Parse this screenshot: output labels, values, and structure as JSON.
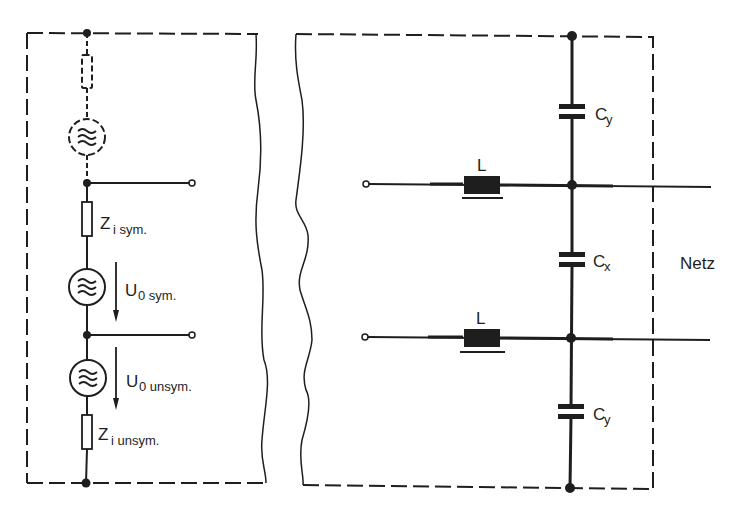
{
  "diagram": {
    "type": "circuit-schematic",
    "colors": {
      "background": "#ffffff",
      "ink": "#1e1e1e"
    },
    "left_block": {
      "description": "Noise source equivalent circuit",
      "components": [
        {
          "id": "r_dashed",
          "kind": "resistor",
          "style": "dashed",
          "label": ""
        },
        {
          "id": "src_dashed",
          "kind": "ac-source",
          "style": "dashed",
          "label": ""
        },
        {
          "id": "zi_sym",
          "kind": "resistor",
          "label_main": "Z",
          "label_sub": "i sym."
        },
        {
          "id": "u0_sym",
          "kind": "ac-source",
          "label_main": "U",
          "label_sub": "0 sym."
        },
        {
          "id": "u0_unsym",
          "kind": "ac-source",
          "label_main": "U",
          "label_sub": "0 unsym."
        },
        {
          "id": "zi_unsym",
          "kind": "resistor",
          "label_main": "Z",
          "label_sub": "i unsym."
        }
      ],
      "terminals": 2
    },
    "right_block": {
      "description": "Line filter network",
      "components": [
        {
          "id": "l_top",
          "kind": "inductor",
          "label": "L"
        },
        {
          "id": "l_bottom",
          "kind": "inductor",
          "label": "L"
        },
        {
          "id": "cy_top",
          "kind": "capacitor",
          "label_main": "C",
          "label_sub": "y"
        },
        {
          "id": "cx",
          "kind": "capacitor",
          "label_main": "C",
          "label_sub": "x"
        },
        {
          "id": "cy_bottom",
          "kind": "capacitor",
          "label_main": "C",
          "label_sub": "y"
        }
      ],
      "terminals": 2
    },
    "labels": {
      "zi_sym_main": "Z",
      "zi_sym_sub": "i sym.",
      "u0_sym_main": "U",
      "u0_sym_sub": "0 sym.",
      "u0_unsym_main": "U",
      "u0_unsym_sub": "0 unsym.",
      "zi_unsym_main": "Z",
      "zi_unsym_sub": "i unsym.",
      "l_top": "L",
      "l_bottom": "L",
      "cy_top_main": "C",
      "cy_top_sub": "y",
      "cx_main": "C",
      "cx_sub": "x",
      "cy_bottom_main": "C",
      "cy_bottom_sub": "y",
      "netz": "Netz"
    }
  }
}
